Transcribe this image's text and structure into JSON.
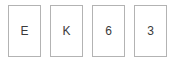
{
  "widget": {
    "name": "character-entry-boxes",
    "background_color": "#ffffff",
    "box_border_color": "#b3b3b3",
    "box_fill_color": "#ffffff",
    "text_color": "#3a3a3a",
    "cells": [
      {
        "value": "E"
      },
      {
        "value": "K"
      },
      {
        "value": "6"
      },
      {
        "value": "3"
      }
    ]
  }
}
